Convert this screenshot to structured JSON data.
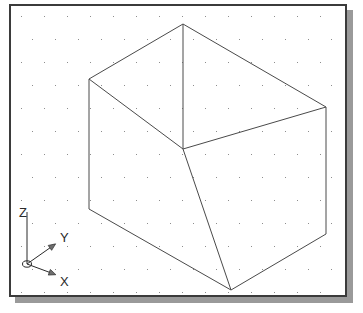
{
  "viewport": {
    "name": "isometric-drawing-viewport",
    "background_color": "#ffffff",
    "border_color": "#3b3b3b",
    "shadow_color": "#9a9a9a",
    "width": 338,
    "height": 293
  },
  "grid": {
    "name": "snap-dot-grid",
    "dot_color": "#8d8d8d",
    "spacing_x": 23,
    "spacing_y": 23,
    "row_offset_x": 11,
    "origin_x": 10,
    "origin_y": 10,
    "visible": true
  },
  "ucs_icon": {
    "name": "ucs-axis-indicator",
    "origin": {
      "x": 16,
      "y": 258
    },
    "axes": [
      {
        "label": "Z",
        "label_x": 8,
        "label_y": 200,
        "tip_x": 16,
        "tip_y": 206,
        "arrow": false
      },
      {
        "label": "Y",
        "label_x": 49,
        "label_y": 225,
        "tip_x": 43,
        "tip_y": 239,
        "arrow": true
      },
      {
        "label": "X",
        "label_x": 49,
        "label_y": 269,
        "tip_x": 43,
        "tip_y": 268,
        "arrow": true
      }
    ],
    "line_color": "#2a2a2a"
  },
  "solid": {
    "name": "isometric-rectangular-box",
    "line_color": "#4a4a4a",
    "line_width": 1,
    "description": "Wireframe rectangular prism drawn in isometric projection, three visible faces",
    "vertices": {
      "top_back": {
        "x": 172,
        "y": 18
      },
      "top_left": {
        "x": 78,
        "y": 73
      },
      "top_right": {
        "x": 315,
        "y": 101
      },
      "top_front": {
        "x": 172,
        "y": 143
      },
      "bottom_left": {
        "x": 78,
        "y": 203
      },
      "bottom_front": {
        "x": 220,
        "y": 284
      },
      "bottom_right": {
        "x": 315,
        "y": 228
      }
    },
    "edges": [
      [
        "top_back",
        "top_left"
      ],
      [
        "top_back",
        "top_right"
      ],
      [
        "top_left",
        "top_front"
      ],
      [
        "top_right",
        "top_front"
      ],
      [
        "top_back",
        "top_front"
      ],
      [
        "top_left",
        "bottom_left"
      ],
      [
        "top_front",
        "bottom_front"
      ],
      [
        "top_right",
        "bottom_right"
      ],
      [
        "bottom_left",
        "bottom_front"
      ],
      [
        "bottom_front",
        "bottom_right"
      ]
    ]
  }
}
